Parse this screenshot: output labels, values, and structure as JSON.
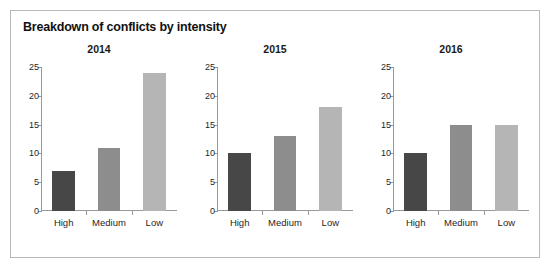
{
  "chart_data": {
    "type": "bar",
    "title": "Breakdown of conflicts by intensity",
    "xlabel": "",
    "ylabel": "",
    "ylim": [
      0,
      25
    ],
    "yticks": [
      0,
      5,
      10,
      15,
      20,
      25
    ],
    "grid": false,
    "legend": "none",
    "categories": [
      "High",
      "Medium",
      "Low"
    ],
    "category_colors": [
      "#474747",
      "#8d8d8d",
      "#b5b5b5"
    ],
    "panels": [
      {
        "title": "2014",
        "categories": [
          "High",
          "Medium",
          "Low"
        ],
        "values": [
          7,
          11,
          24
        ]
      },
      {
        "title": "2015",
        "categories": [
          "High",
          "Medium",
          "Low"
        ],
        "values": [
          10,
          13,
          18
        ]
      },
      {
        "title": "2016",
        "categories": [
          "High",
          "Medium",
          "Low"
        ],
        "values": [
          10,
          15,
          15
        ]
      }
    ],
    "series": [
      {
        "name": "High",
        "values": [
          7,
          10,
          10
        ]
      },
      {
        "name": "Medium",
        "values": [
          11,
          13,
          15
        ]
      },
      {
        "name": "Low",
        "values": [
          24,
          18,
          15
        ]
      }
    ],
    "x": [
      "2014",
      "2015",
      "2016"
    ]
  },
  "figure": {
    "border_color": "#b9b9b9",
    "background": "#ffffff",
    "axis_color": "#999999",
    "text_color": "#1f1f1f"
  }
}
